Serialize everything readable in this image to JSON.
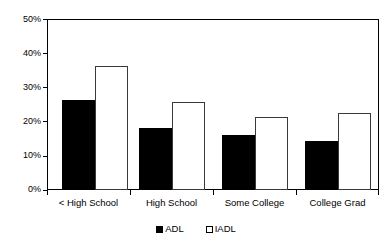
{
  "chart_data": {
    "type": "bar",
    "title": "",
    "subtitle": "",
    "xlabel": "",
    "ylabel": "",
    "categories": [
      "< High School",
      "High School",
      "Some College",
      "College Grad"
    ],
    "series": [
      {
        "name": "ADL",
        "values": [
          26.3,
          18.0,
          16.0,
          14.3
        ],
        "fill": "#000000",
        "stroke": "#000000"
      },
      {
        "name": "IADL",
        "values": [
          36.1,
          25.6,
          21.3,
          22.4
        ],
        "fill": "#ffffff",
        "stroke": "#3a3a3a"
      }
    ],
    "ylim": [
      0,
      50
    ],
    "ytick_values": [
      0,
      10,
      20,
      30,
      40,
      50
    ],
    "ytick_labels": [
      "0%",
      "10%",
      "20%",
      "30%",
      "40%",
      "50%"
    ],
    "grid": false,
    "legend_position": "bottom-center",
    "legend_entries": [
      "ADL",
      "IADL"
    ],
    "plot_border": true,
    "value_format": "percent"
  },
  "legend": {
    "items": [
      {
        "label": "ADL"
      },
      {
        "label": "IADL"
      }
    ]
  }
}
